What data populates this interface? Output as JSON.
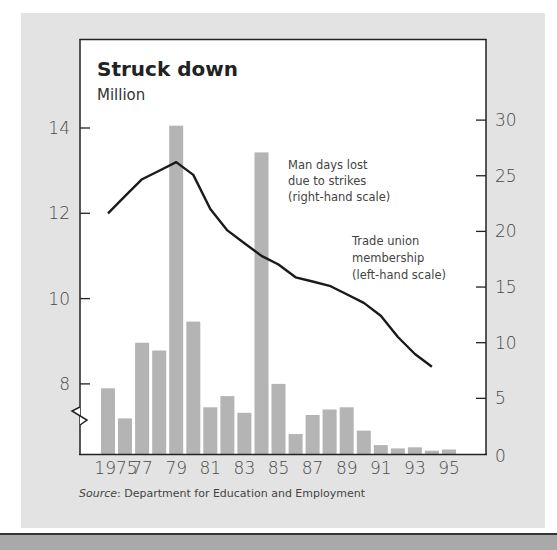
{
  "chart_data": {
    "type": "bar+line",
    "title": "Struck down",
    "subtitle": "Million",
    "source_label": "Source",
    "source_text": ": Department for Education and Employment",
    "x_tick_labels": [
      "1975",
      "77",
      "79",
      "81",
      "83",
      "85",
      "87",
      "89",
      "91",
      "93",
      "95"
    ],
    "categories": [
      1975,
      1976,
      1977,
      1978,
      1979,
      1980,
      1981,
      1982,
      1983,
      1984,
      1985,
      1986,
      1987,
      1988,
      1989,
      1990,
      1991,
      1992,
      1993,
      1994,
      1995
    ],
    "left_axis": {
      "label": "Trade union membership (left-hand scale)",
      "ticks": [
        8,
        10,
        12,
        14
      ],
      "range": [
        6.5,
        14.5
      ],
      "broken": true
    },
    "right_axis": {
      "label": "Man days lost due to strikes (right-hand scale)",
      "ticks": [
        0,
        5,
        10,
        15,
        20,
        25,
        30
      ],
      "range": [
        0,
        30
      ]
    },
    "series": [
      {
        "name": "Man days lost due to strikes (right-hand scale)",
        "type": "bar",
        "axis": "right",
        "color": "#b4b4b4",
        "values": [
          5.9,
          3.2,
          10.0,
          9.3,
          29.5,
          11.9,
          4.2,
          5.2,
          3.7,
          27.1,
          6.3,
          1.8,
          3.5,
          4.0,
          4.2,
          2.1,
          0.8,
          0.5,
          0.6,
          0.3,
          0.4
        ]
      },
      {
        "name": "Trade union membership (left-hand scale)",
        "type": "line",
        "axis": "left",
        "color": "#1a1a1a",
        "x": [
          1975,
          1976,
          1977,
          1978,
          1979,
          1980,
          1981,
          1982,
          1983,
          1984,
          1985,
          1986,
          1987,
          1988,
          1989,
          1990,
          1991,
          1992,
          1993,
          1994
        ],
        "values": [
          12.0,
          12.4,
          12.8,
          13.0,
          13.2,
          12.9,
          12.1,
          11.6,
          11.3,
          11.0,
          10.8,
          10.5,
          10.4,
          10.3,
          10.1,
          9.9,
          9.6,
          9.1,
          8.7,
          8.4
        ]
      }
    ],
    "annotations": {
      "bars_label": [
        "Man days lost",
        "due to strikes",
        "(right-hand scale)"
      ],
      "line_label": [
        "Trade union",
        "membership",
        "(left-hand scale)"
      ]
    },
    "grid": false
  },
  "colors": {
    "panel": "#e3e3e3",
    "plot_bg": "#ffffff",
    "bar": "#b4b4b4",
    "line": "#1a1a1a",
    "axis": "#222222"
  }
}
